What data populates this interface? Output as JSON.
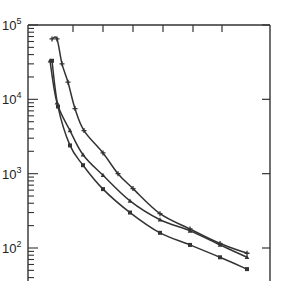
{
  "chart_data": {
    "type": "line",
    "title": "",
    "xlabel": "",
    "ylabel": "",
    "yscale": "log",
    "ylim": [
      30,
      100000
    ],
    "y_tick_labels": [
      "10^5",
      "10^4",
      "10^3",
      "10^2"
    ],
    "y_ticks": [
      100000,
      10000,
      1000,
      100
    ],
    "x_tick_labels": [],
    "grid": false,
    "legend": null,
    "line_color": "#333333",
    "series": [
      {
        "name": "upper (+ markers)",
        "marker": "plus",
        "points": [
          [
            52,
            65000
          ],
          [
            57,
            65000
          ],
          [
            62,
            30000
          ],
          [
            68,
            17000
          ],
          [
            75,
            7500
          ],
          [
            84,
            3800
          ],
          [
            103,
            1900
          ],
          [
            118,
            1000
          ],
          [
            133,
            630
          ],
          [
            160,
            290
          ],
          [
            190,
            180
          ],
          [
            220,
            115
          ],
          [
            247,
            85
          ]
        ]
      },
      {
        "name": "middle",
        "marker": "triangle",
        "points": [
          [
            50,
            33000
          ],
          [
            57,
            9000
          ],
          [
            70,
            3800
          ],
          [
            83,
            1800
          ],
          [
            103,
            950
          ],
          [
            130,
            430
          ],
          [
            160,
            240
          ],
          [
            190,
            170
          ],
          [
            220,
            110
          ],
          [
            247,
            75
          ]
        ]
      },
      {
        "name": "lower",
        "marker": "square",
        "points": [
          [
            52,
            33000
          ],
          [
            58,
            8000
          ],
          [
            70,
            2400
          ],
          [
            83,
            1300
          ],
          [
            103,
            620
          ],
          [
            130,
            300
          ],
          [
            160,
            160
          ],
          [
            190,
            110
          ],
          [
            220,
            75
          ],
          [
            247,
            52
          ]
        ]
      }
    ]
  },
  "axes": {
    "y_labels": [
      {
        "base": "10",
        "exp": "5"
      },
      {
        "base": "10",
        "exp": "4"
      },
      {
        "base": "10",
        "exp": "3"
      },
      {
        "base": "10",
        "exp": "2"
      }
    ]
  }
}
